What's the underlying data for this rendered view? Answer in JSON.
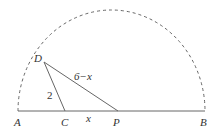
{
  "figure": {
    "type": "geometry",
    "points": {
      "A": "A",
      "B": "B",
      "C": "C",
      "P": "P",
      "D": "D"
    },
    "segment_labels": {
      "DC": "2",
      "DP": "6−x",
      "CP": "x"
    },
    "colors": {
      "stroke": "#666666",
      "text": "#333333"
    }
  }
}
